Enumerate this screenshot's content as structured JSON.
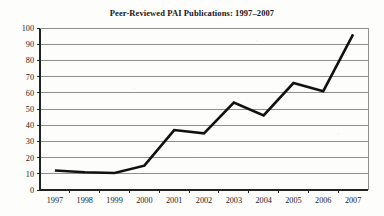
{
  "chart_data": {
    "type": "line",
    "title": "Peer-Reviewed PAI Publications: 1997–2007",
    "xlabel": "",
    "ylabel": "",
    "categories": [
      "1997",
      "1998",
      "1999",
      "2000",
      "2001",
      "2002",
      "2003",
      "2004",
      "2005",
      "2006",
      "2007"
    ],
    "values": [
      12,
      11,
      10.5,
      15,
      37,
      35,
      54,
      46,
      66,
      61,
      96
    ],
    "series": [
      {
        "name": "Peer-Reviewed PAI Publications",
        "values": [
          12,
          11,
          10.5,
          15,
          37,
          35,
          54,
          46,
          66,
          61,
          96
        ]
      }
    ],
    "ylim": [
      0,
      100
    ],
    "ytick_labels": [
      "0",
      "10",
      "20",
      "30",
      "40",
      "50",
      "60",
      "70",
      "80",
      "90",
      "100"
    ],
    "ytick_values": [
      0,
      10,
      20,
      30,
      40,
      50,
      60,
      70,
      80,
      90,
      100
    ],
    "xtick_labels": [
      "1997",
      "1998",
      "1999",
      "2000",
      "2001",
      "2002",
      "2003",
      "2004",
      "2005",
      "2006",
      "2007"
    ],
    "grid": true,
    "grid_axis": "y",
    "legend": false,
    "legend_position": "none",
    "line_color": "#111111",
    "grid_color": "#8f8f8f",
    "axis_color": "#222222",
    "background_color": "#fdfdfc",
    "annotations": []
  }
}
